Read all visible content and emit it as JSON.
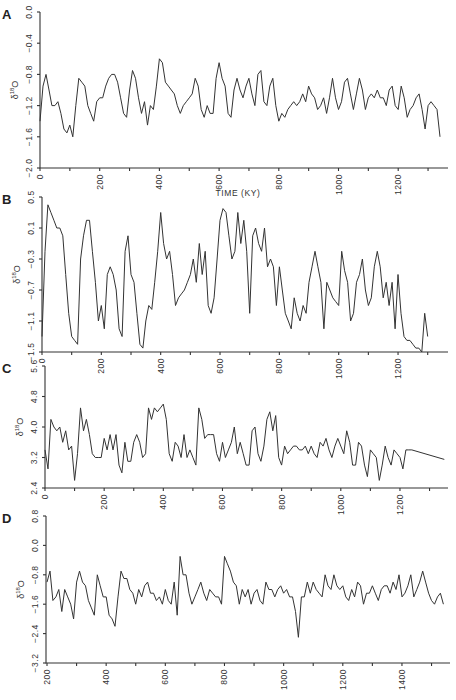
{
  "chart_data": [
    {
      "panel": "A",
      "type": "line",
      "xlabel": "TIME (KY)",
      "ylabel": "δ18O",
      "xlim": [
        0,
        1350
      ],
      "ylim": [
        -2.0,
        0.0
      ],
      "x_ticks": [
        0,
        200,
        400,
        600,
        800,
        1000,
        1200
      ],
      "y_ticks": [
        -2.0,
        -1.6,
        -1.2,
        -0.8,
        -0.4,
        0.0
      ],
      "x": [
        0,
        10,
        20,
        30,
        40,
        50,
        60,
        70,
        80,
        90,
        100,
        110,
        120,
        130,
        140,
        150,
        160,
        170,
        180,
        190,
        200,
        210,
        220,
        230,
        240,
        250,
        260,
        270,
        280,
        290,
        300,
        310,
        320,
        330,
        340,
        350,
        360,
        370,
        380,
        390,
        400,
        410,
        420,
        430,
        440,
        450,
        460,
        470,
        480,
        490,
        500,
        510,
        520,
        530,
        540,
        550,
        560,
        570,
        580,
        590,
        600,
        610,
        620,
        630,
        640,
        650,
        660,
        670,
        680,
        690,
        700,
        710,
        720,
        730,
        740,
        750,
        760,
        770,
        780,
        790,
        800,
        810,
        820,
        830,
        840,
        850,
        860,
        870,
        880,
        890,
        900,
        910,
        920,
        930,
        940,
        950,
        960,
        970,
        980,
        990,
        1000,
        1010,
        1020,
        1030,
        1040,
        1050,
        1060,
        1070,
        1080,
        1090,
        1100,
        1110,
        1120,
        1130,
        1140,
        1150,
        1160,
        1170,
        1180,
        1190,
        1200,
        1210,
        1220,
        1230,
        1240,
        1250,
        1260,
        1270,
        1280,
        1290,
        1300,
        1310,
        1320,
        1330,
        1340
      ],
      "values": [
        -1.4,
        -0.95,
        -0.8,
        -1.0,
        -1.2,
        -1.2,
        -1.15,
        -1.3,
        -1.5,
        -1.55,
        -1.45,
        -1.6,
        -1.2,
        -0.85,
        -0.9,
        -0.95,
        -1.2,
        -1.3,
        -1.4,
        -1.15,
        -1.1,
        -1.1,
        -0.95,
        -0.85,
        -0.8,
        -0.8,
        -0.9,
        -1.1,
        -1.3,
        -1.35,
        -1.0,
        -0.75,
        -0.85,
        -1.1,
        -1.3,
        -1.15,
        -1.45,
        -1.2,
        -1.25,
        -0.95,
        -0.6,
        -0.65,
        -0.9,
        -0.95,
        -1.0,
        -1.05,
        -1.2,
        -1.3,
        -1.2,
        -1.15,
        -1.1,
        -1.05,
        -0.85,
        -0.95,
        -1.25,
        -1.35,
        -1.2,
        -1.3,
        -1.3,
        -0.85,
        -0.65,
        -0.85,
        -0.95,
        -1.3,
        -1.35,
        -1.0,
        -0.85,
        -1.0,
        -1.1,
        -0.95,
        -0.85,
        -1.05,
        -1.2,
        -0.8,
        -0.75,
        -1.15,
        -1.2,
        -0.95,
        -0.85,
        -1.2,
        -1.4,
        -1.3,
        -1.35,
        -1.25,
        -1.2,
        -1.15,
        -1.2,
        -1.15,
        -1.05,
        -1.15,
        -0.95,
        -1.05,
        -1.1,
        -1.25,
        -1.2,
        -1.1,
        -1.3,
        -1.1,
        -0.85,
        -1.1,
        -1.25,
        -1.15,
        -0.9,
        -0.85,
        -1.05,
        -1.25,
        -1.05,
        -0.85,
        -1.0,
        -1.25,
        -1.1,
        -1.05,
        -1.1,
        -1.0,
        -1.1,
        -1.1,
        -1.2,
        -1.0,
        -0.95,
        -1.2,
        -1.25,
        -0.95,
        -1.1,
        -1.35,
        -1.25,
        -1.2,
        -1.1,
        -1.05,
        -1.25,
        -1.5,
        -1.2,
        -1.15,
        -1.2,
        -1.25,
        -1.6
      ]
    },
    {
      "panel": "B",
      "type": "line",
      "xlabel": "",
      "ylabel": "δ18O",
      "xlim": [
        0,
        1350
      ],
      "ylim": [
        -1.5,
        0.5
      ],
      "x_ticks": [
        0,
        200,
        400,
        600,
        800,
        1000,
        1200
      ],
      "y_ticks": [
        -1.5,
        -1.1,
        -0.7,
        -0.3,
        0.1,
        0.5
      ],
      "x": [
        0,
        10,
        20,
        30,
        40,
        50,
        60,
        70,
        80,
        90,
        100,
        110,
        120,
        130,
        140,
        150,
        160,
        170,
        180,
        190,
        200,
        210,
        220,
        230,
        240,
        250,
        260,
        270,
        280,
        290,
        300,
        310,
        320,
        330,
        340,
        350,
        360,
        370,
        380,
        390,
        400,
        410,
        420,
        430,
        440,
        450,
        460,
        470,
        480,
        490,
        500,
        510,
        520,
        530,
        540,
        550,
        560,
        570,
        580,
        590,
        600,
        610,
        620,
        630,
        640,
        650,
        660,
        670,
        680,
        690,
        700,
        710,
        720,
        730,
        740,
        750,
        760,
        770,
        780,
        790,
        800,
        810,
        820,
        830,
        840,
        850,
        860,
        870,
        880,
        890,
        900,
        910,
        920,
        930,
        940,
        950,
        960,
        970,
        980,
        990,
        1000,
        1010,
        1020,
        1030,
        1040,
        1050,
        1060,
        1070,
        1080,
        1090,
        1100,
        1110,
        1120,
        1130,
        1140,
        1150,
        1160,
        1170,
        1180,
        1190,
        1200,
        1210,
        1220,
        1230,
        1240,
        1250,
        1260,
        1270,
        1280,
        1290,
        1300,
        1310,
        1320,
        1330,
        1340
      ],
      "values": [
        -1.3,
        -0.2,
        0.4,
        0.3,
        0.2,
        0.1,
        0.1,
        0.0,
        -0.5,
        -1.0,
        -1.3,
        -1.35,
        -1.4,
        -0.3,
        0.0,
        0.2,
        0.2,
        -0.2,
        -0.6,
        -1.1,
        -0.9,
        -1.2,
        -0.5,
        -0.4,
        -0.5,
        -0.7,
        -1.2,
        -1.3,
        -0.2,
        0.0,
        -0.5,
        -0.6,
        -1.0,
        -1.4,
        -1.45,
        -1.1,
        -0.9,
        -0.95,
        -0.6,
        -0.2,
        0.3,
        -0.1,
        -0.3,
        -0.2,
        -0.5,
        -0.9,
        -0.8,
        -0.75,
        -0.7,
        -0.6,
        -0.5,
        -0.3,
        -0.6,
        -0.1,
        -0.5,
        -0.2,
        -0.9,
        -1.0,
        -0.8,
        -0.3,
        0.2,
        0.35,
        0.3,
        0.0,
        -0.3,
        -0.2,
        0.3,
        -0.1,
        0.2,
        -0.2,
        -1.0,
        0.0,
        0.1,
        -0.1,
        -0.2,
        0.1,
        -0.4,
        -0.3,
        -0.4,
        -0.9,
        -0.4,
        -0.7,
        -1.0,
        -1.1,
        -1.2,
        -0.8,
        -1.0,
        -1.1,
        -0.9,
        -1.0,
        -0.6,
        -0.4,
        -0.2,
        -0.4,
        -0.6,
        -1.2,
        -0.6,
        -0.7,
        -0.8,
        -0.85,
        -0.9,
        -0.2,
        -0.45,
        -0.6,
        -1.1,
        -1.0,
        -0.6,
        -0.5,
        -0.3,
        -0.7,
        -0.9,
        -0.8,
        -0.4,
        -0.2,
        -0.4,
        -0.8,
        -0.6,
        -0.9,
        -0.6,
        -1.2,
        -0.5,
        -1.0,
        -1.3,
        -1.35,
        -1.35,
        -1.4,
        -1.45,
        -1.45,
        -1.5,
        -1.0,
        -1.3
      ]
    },
    {
      "panel": "C",
      "type": "line",
      "xlabel": "",
      "ylabel": "δ18O",
      "xlim": [
        0,
        1350
      ],
      "ylim": [
        2.4,
        5.6
      ],
      "x_ticks": [
        0,
        200,
        400,
        600,
        800,
        1000,
        1200
      ],
      "y_ticks": [
        2.4,
        3.2,
        4.0,
        4.8,
        5.6
      ],
      "x": [
        0,
        10,
        20,
        30,
        40,
        50,
        60,
        70,
        80,
        90,
        100,
        110,
        120,
        130,
        140,
        150,
        160,
        170,
        180,
        190,
        200,
        210,
        220,
        230,
        240,
        250,
        260,
        270,
        280,
        290,
        300,
        310,
        320,
        330,
        340,
        350,
        360,
        370,
        380,
        390,
        400,
        410,
        420,
        430,
        440,
        450,
        460,
        470,
        480,
        490,
        500,
        510,
        520,
        530,
        540,
        550,
        560,
        570,
        580,
        590,
        600,
        610,
        620,
        630,
        640,
        650,
        660,
        670,
        680,
        690,
        700,
        710,
        720,
        730,
        740,
        750,
        760,
        770,
        780,
        790,
        800,
        810,
        820,
        830,
        840,
        850,
        860,
        870,
        880,
        890,
        900,
        910,
        920,
        930,
        940,
        950,
        960,
        970,
        980,
        990,
        1000,
        1010,
        1020,
        1030,
        1040,
        1050,
        1060,
        1070,
        1080,
        1090,
        1100,
        1110,
        1120,
        1130,
        1140,
        1150,
        1160,
        1170,
        1180,
        1190,
        1200,
        1210,
        1220,
        1230,
        1240,
        1350
      ],
      "values": [
        3.4,
        2.9,
        4.2,
        4.0,
        3.9,
        4.0,
        3.6,
        3.9,
        3.4,
        3.5,
        2.6,
        3.3,
        4.5,
        3.9,
        4.2,
        3.8,
        3.3,
        3.2,
        3.2,
        3.2,
        3.7,
        3.4,
        3.8,
        3.4,
        3.8,
        3.0,
        2.8,
        3.6,
        3.1,
        3.1,
        3.6,
        3.8,
        3.6,
        3.2,
        3.3,
        4.5,
        4.2,
        4.5,
        4.4,
        4.5,
        4.6,
        4.2,
        3.3,
        3.1,
        3.6,
        3.5,
        3.2,
        3.8,
        3.2,
        3.4,
        3.2,
        3.0,
        4.5,
        4.2,
        3.7,
        3.8,
        3.8,
        3.8,
        3.3,
        3.1,
        3.6,
        3.2,
        3.4,
        3.6,
        4.0,
        3.3,
        3.6,
        3.3,
        3.0,
        3.0,
        3.9,
        4.0,
        3.3,
        3.1,
        3.5,
        4.2,
        4.4,
        3.9,
        4.3,
        3.2,
        3.0,
        3.5,
        3.3,
        3.4,
        3.5,
        3.5,
        3.4,
        3.4,
        3.5,
        3.3,
        3.5,
        3.3,
        3.2,
        3.6,
        3.5,
        3.7,
        3.4,
        3.2,
        3.5,
        3.7,
        3.5,
        3.3,
        3.9,
        3.6,
        3.0,
        3.0,
        3.6,
        3.5,
        3.0,
        2.7,
        3.4,
        3.3,
        3.2,
        2.6,
        3.0,
        3.5,
        3.2,
        3.0,
        3.4,
        3.3,
        3.2,
        2.9,
        3.4,
        3.4,
        3.4,
        3.15
      ]
    },
    {
      "panel": "D",
      "type": "line",
      "xlabel": "",
      "ylabel": "δ18O",
      "xlim": [
        200,
        1550
      ],
      "ylim": [
        -3.2,
        0.8
      ],
      "x_ticks": [
        200,
        400,
        600,
        800,
        1000,
        1200,
        1400
      ],
      "y_ticks": [
        -3.2,
        -2.4,
        -1.6,
        -0.8,
        0.0,
        0.8
      ],
      "x": [
        200,
        210,
        220,
        230,
        240,
        250,
        260,
        270,
        280,
        290,
        300,
        310,
        320,
        330,
        340,
        350,
        360,
        370,
        380,
        390,
        400,
        410,
        420,
        430,
        440,
        450,
        460,
        470,
        480,
        490,
        500,
        510,
        520,
        530,
        540,
        550,
        560,
        570,
        580,
        590,
        600,
        610,
        620,
        630,
        640,
        650,
        660,
        670,
        680,
        690,
        700,
        710,
        720,
        730,
        740,
        750,
        760,
        770,
        780,
        790,
        800,
        810,
        820,
        830,
        840,
        850,
        860,
        870,
        880,
        890,
        900,
        910,
        920,
        930,
        940,
        950,
        960,
        970,
        980,
        990,
        1000,
        1010,
        1020,
        1030,
        1040,
        1050,
        1060,
        1070,
        1080,
        1090,
        1100,
        1110,
        1120,
        1130,
        1140,
        1150,
        1160,
        1170,
        1180,
        1190,
        1200,
        1210,
        1220,
        1230,
        1240,
        1250,
        1260,
        1270,
        1280,
        1290,
        1300,
        1310,
        1320,
        1330,
        1340,
        1350,
        1360,
        1370,
        1380,
        1390,
        1400,
        1410,
        1420,
        1430,
        1440,
        1450,
        1460,
        1470,
        1480,
        1490,
        1500,
        1510,
        1520,
        1530,
        1540
      ],
      "values": [
        -1.0,
        -0.7,
        -1.5,
        -1.4,
        -1.2,
        -1.8,
        -1.2,
        -1.4,
        -1.6,
        -2.0,
        -1.0,
        -0.7,
        -1.0,
        -1.1,
        -1.5,
        -1.7,
        -1.9,
        -0.8,
        -1.1,
        -1.4,
        -1.4,
        -1.9,
        -2.0,
        -2.2,
        -1.4,
        -0.7,
        -0.9,
        -0.9,
        -1.2,
        -1.3,
        -1.6,
        -1.2,
        -1.4,
        -1.1,
        -1.0,
        -1.3,
        -1.3,
        -1.5,
        -1.4,
        -1.6,
        -1.2,
        -1.5,
        -1.6,
        -1.0,
        -1.9,
        -0.3,
        -0.8,
        -0.8,
        -1.3,
        -1.6,
        -1.4,
        -1.2,
        -1.0,
        -1.3,
        -1.5,
        -1.2,
        -1.3,
        -1.4,
        -1.4,
        -1.6,
        -0.3,
        -0.5,
        -0.7,
        -1.0,
        -1.1,
        -1.6,
        -1.2,
        -1.4,
        -1.2,
        -1.6,
        -1.3,
        -1.2,
        -1.5,
        -1.6,
        -1.0,
        -1.2,
        -1.2,
        -1.4,
        -1.2,
        -1.1,
        -1.3,
        -1.2,
        -1.4,
        -1.4,
        -1.8,
        -2.5,
        -1.4,
        -1.4,
        -1.0,
        -1.3,
        -1.0,
        -1.2,
        -1.3,
        -1.4,
        -0.8,
        -1.1,
        -1.2,
        -0.8,
        -1.1,
        -1.2,
        -1.1,
        -1.4,
        -1.5,
        -1.2,
        -1.4,
        -1.0,
        -1.1,
        -1.6,
        -1.3,
        -1.3,
        -1.1,
        -1.3,
        -1.5,
        -1.2,
        -1.1,
        -1.1,
        -1.3,
        -1.0,
        -1.2,
        -0.8,
        -1.4,
        -1.3,
        -1.1,
        -0.8,
        -1.4,
        -1.2,
        -1.0,
        -0.7,
        -1.0,
        -1.3,
        -1.5,
        -1.6,
        -1.4,
        -1.3,
        -1.6
      ]
    }
  ]
}
